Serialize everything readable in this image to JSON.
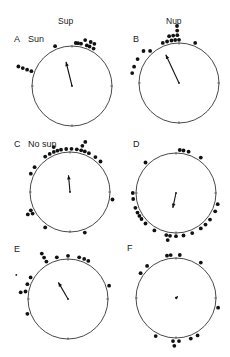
{
  "chart_data": {
    "type": "scatter",
    "subtype": "circular-orientation-plot",
    "column_headers": [
      "Sup",
      "Nup"
    ],
    "panels": [
      {
        "id": "A",
        "label": "A",
        "condition": "Sun",
        "column": "Sup",
        "dots": [
          {
            "bearing": 337,
            "ring": 0
          },
          {
            "bearing": 5,
            "ring": 0
          },
          {
            "bearing": 8,
            "ring": 0
          },
          {
            "bearing": 12,
            "ring": 0
          },
          {
            "bearing": 20,
            "ring": 0
          },
          {
            "bearing": 23,
            "ring": 1
          },
          {
            "bearing": 28,
            "ring": 1
          },
          {
            "bearing": 24,
            "ring": 0
          },
          {
            "bearing": 30,
            "ring": 0
          },
          {
            "bearing": 16,
            "ring": 1
          },
          {
            "bearing": 290,
            "ring": 1
          },
          {
            "bearing": 290,
            "ring": 2
          },
          {
            "bearing": 290,
            "ring": 3
          },
          {
            "bearing": 290,
            "ring": 0
          }
        ],
        "mean_vector": {
          "direction_deg": 346,
          "length": 0.62
        }
      },
      {
        "id": "B",
        "label": "B",
        "condition": "",
        "column": "Nup",
        "dots": [
          {
            "bearing": 338,
            "ring": 0
          },
          {
            "bearing": 344,
            "ring": 0
          },
          {
            "bearing": 350,
            "ring": 0
          },
          {
            "bearing": 355,
            "ring": 0
          },
          {
            "bearing": 0,
            "ring": 0
          },
          {
            "bearing": 22,
            "ring": 0
          },
          {
            "bearing": 348,
            "ring": 1
          },
          {
            "bearing": 353,
            "ring": 1
          },
          {
            "bearing": 358,
            "ring": 1
          },
          {
            "bearing": 358,
            "ring": 2
          },
          {
            "bearing": 358,
            "ring": 3
          },
          {
            "bearing": 318,
            "ring": 0
          },
          {
            "bearing": 312,
            "ring": 1
          },
          {
            "bearing": 300,
            "ring": 1
          },
          {
            "bearing": 290,
            "ring": 1
          },
          {
            "bearing": 282,
            "ring": 1
          }
        ],
        "mean_vector": {
          "direction_deg": 335,
          "length": 0.78
        }
      },
      {
        "id": "C",
        "label": "C",
        "condition": "No sun",
        "column": "Sup",
        "dots": [
          {
            "bearing": 325,
            "ring": 0
          },
          {
            "bearing": 332,
            "ring": 0
          },
          {
            "bearing": 338,
            "ring": 0
          },
          {
            "bearing": 343,
            "ring": 0
          },
          {
            "bearing": 348,
            "ring": 0
          },
          {
            "bearing": 355,
            "ring": 0
          },
          {
            "bearing": 2,
            "ring": 0
          },
          {
            "bearing": 9,
            "ring": 0
          },
          {
            "bearing": 15,
            "ring": 0
          },
          {
            "bearing": 20,
            "ring": 0
          },
          {
            "bearing": 26,
            "ring": 0
          },
          {
            "bearing": 36,
            "ring": 0
          },
          {
            "bearing": 45,
            "ring": 0
          },
          {
            "bearing": 340,
            "ring": 1
          },
          {
            "bearing": 15,
            "ring": 1
          },
          {
            "bearing": 17,
            "ring": 2
          },
          {
            "bearing": 305,
            "ring": 0
          },
          {
            "bearing": 295,
            "ring": 0
          },
          {
            "bearing": 240,
            "ring": 0
          },
          {
            "bearing": 245,
            "ring": 0
          },
          {
            "bearing": 242,
            "ring": 1
          },
          {
            "bearing": 215,
            "ring": 0
          },
          {
            "bearing": 100,
            "ring": 0
          },
          {
            "bearing": 160,
            "ring": 0
          }
        ],
        "mean_vector": {
          "direction_deg": 355,
          "length": 0.42
        }
      },
      {
        "id": "D",
        "label": "D",
        "condition": "",
        "column": "Nup",
        "dots": [
          {
            "bearing": 5,
            "ring": 0
          },
          {
            "bearing": 10,
            "ring": 0
          },
          {
            "bearing": 17,
            "ring": 0
          },
          {
            "bearing": 35,
            "ring": 0
          },
          {
            "bearing": 315,
            "ring": 0
          },
          {
            "bearing": 105,
            "ring": 0
          },
          {
            "bearing": 115,
            "ring": 0
          },
          {
            "bearing": 128,
            "ring": 0
          },
          {
            "bearing": 137,
            "ring": 0
          },
          {
            "bearing": 145,
            "ring": 0
          },
          {
            "bearing": 158,
            "ring": 0
          },
          {
            "bearing": 170,
            "ring": 0
          },
          {
            "bearing": 180,
            "ring": 0
          },
          {
            "bearing": 188,
            "ring": 0
          },
          {
            "bearing": 193,
            "ring": 0
          },
          {
            "bearing": 190,
            "ring": 1
          },
          {
            "bearing": 210,
            "ring": 0
          },
          {
            "bearing": 225,
            "ring": 0
          },
          {
            "bearing": 233,
            "ring": 0
          },
          {
            "bearing": 238,
            "ring": 0
          },
          {
            "bearing": 243,
            "ring": 0
          },
          {
            "bearing": 250,
            "ring": 0
          },
          {
            "bearing": 262,
            "ring": 0
          },
          {
            "bearing": 270,
            "ring": 0
          }
        ],
        "mean_vector": {
          "direction_deg": 192,
          "length": 0.38
        }
      },
      {
        "id": "E",
        "label": "E",
        "condition": "",
        "column": "Sup",
        "dots": [
          {
            "bearing": 330,
            "ring": 0
          },
          {
            "bearing": 330,
            "ring": 1
          },
          {
            "bearing": 330,
            "ring": 2
          },
          {
            "bearing": 345,
            "ring": 0
          },
          {
            "bearing": 0,
            "ring": 0
          },
          {
            "bearing": 15,
            "ring": 0
          },
          {
            "bearing": 22,
            "ring": 0
          },
          {
            "bearing": 28,
            "ring": 0
          },
          {
            "bearing": 72,
            "ring": 0
          },
          {
            "bearing": 300,
            "ring": 0
          },
          {
            "bearing": 290,
            "ring": 0
          },
          {
            "bearing": 280,
            "ring": 0
          },
          {
            "bearing": 278,
            "ring": 1
          },
          {
            "bearing": 250,
            "ring": 0
          }
        ],
        "extra_mark": {
          "bearing": 295,
          "ring": 3,
          "kind": "small-dot"
        },
        "mean_vector": {
          "direction_deg": 330,
          "length": 0.48
        }
      },
      {
        "id": "F",
        "label": "F",
        "condition": "",
        "column": "Nup",
        "dots": [
          {
            "bearing": 348,
            "ring": 0
          },
          {
            "bearing": 353,
            "ring": 0
          },
          {
            "bearing": 5,
            "ring": 0
          },
          {
            "bearing": 35,
            "ring": 0
          },
          {
            "bearing": 318,
            "ring": 0
          },
          {
            "bearing": 305,
            "ring": 0
          },
          {
            "bearing": 103,
            "ring": 0
          },
          {
            "bearing": 150,
            "ring": 0
          },
          {
            "bearing": 160,
            "ring": 0
          },
          {
            "bearing": 176,
            "ring": 0
          },
          {
            "bearing": 184,
            "ring": 0
          },
          {
            "bearing": 182,
            "ring": 1
          },
          {
            "bearing": 208,
            "ring": 0
          }
        ],
        "mean_vector": {
          "direction_deg": 50,
          "length": 0.06
        }
      }
    ]
  }
}
